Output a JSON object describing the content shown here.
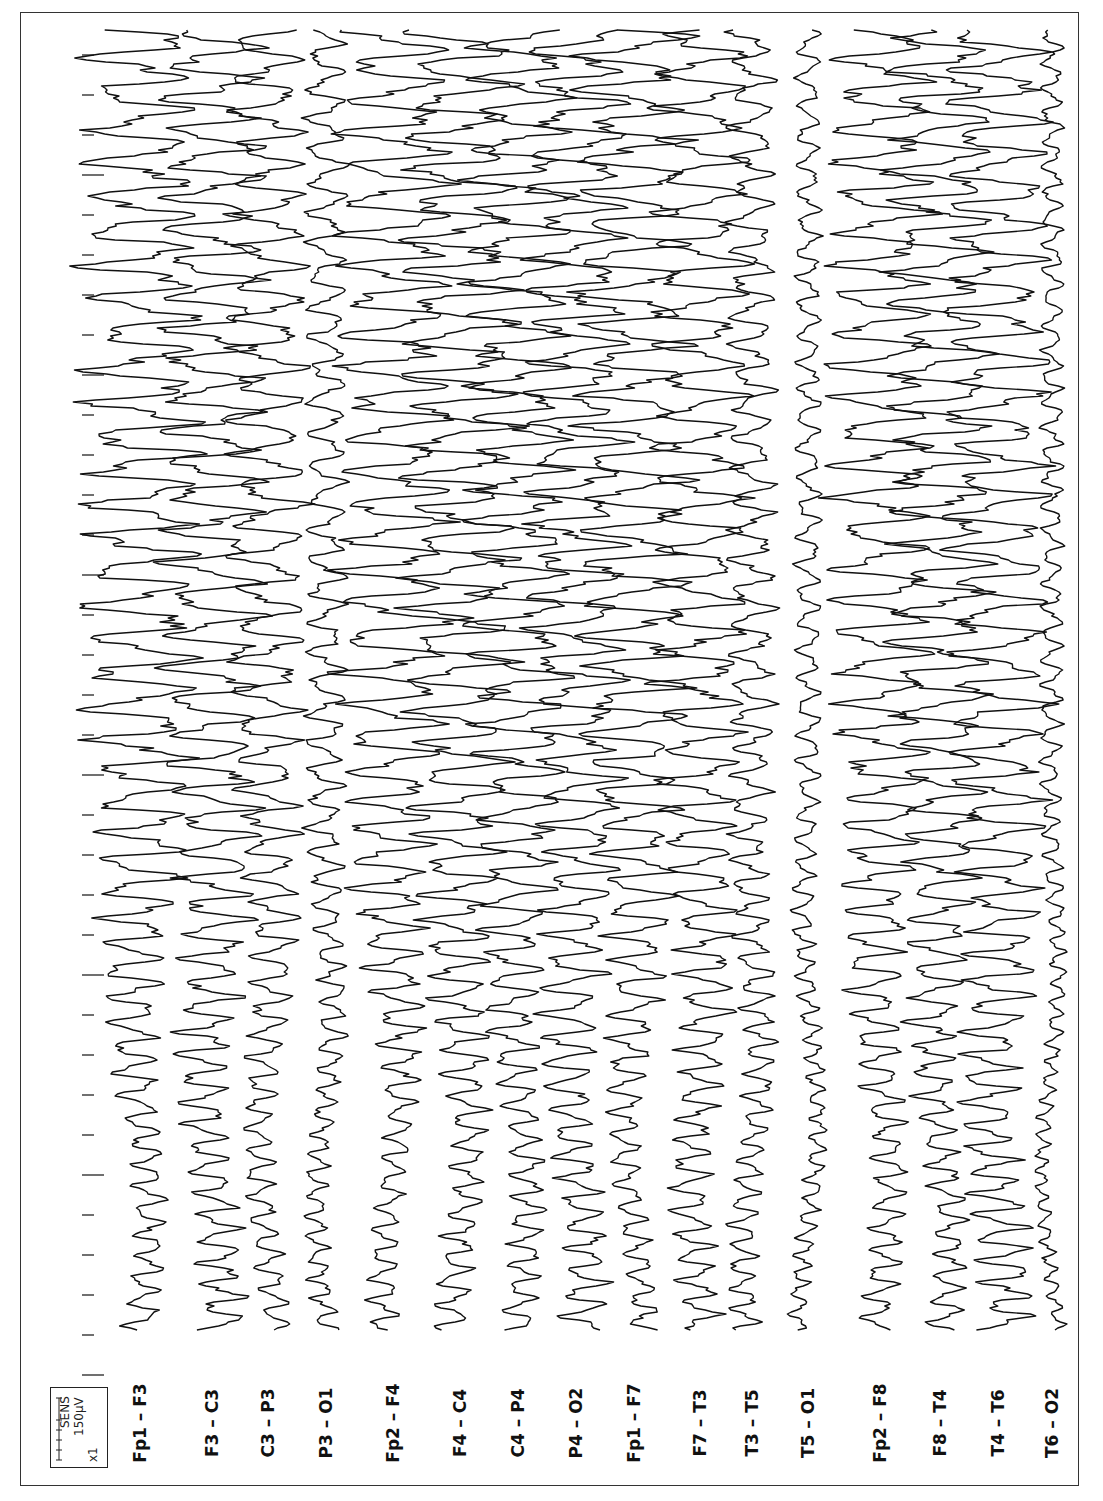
{
  "chart_data": {
    "type": "line",
    "title": "",
    "orientation": "rotated-90-ccw (time runs bottom-to-top, channels left-to-right)",
    "montage": "bipolar longitudinal (double banana)",
    "xlabel": "time (1 s per tick mark)",
    "ylabel": "amplitude",
    "sensitivity": {
      "label": "SENS",
      "value": "150μV",
      "gain": "x1"
    },
    "time_axis": {
      "tick_spacing_px": 40,
      "major_tick_every": 5,
      "tick_count": 34,
      "ticks": "short tick each interval, long tick every 5th"
    },
    "grid": false,
    "legend": "none",
    "series": [
      {
        "name": "Fp1 – F3",
        "baseline_x": 140,
        "onset_amp": 14,
        "ictal_amp": 46,
        "freq": 0.55
      },
      {
        "name": "F3 – C3",
        "baseline_x": 212,
        "onset_amp": 18,
        "ictal_amp": 40,
        "freq": 0.55
      },
      {
        "name": "C3 – P3",
        "baseline_x": 268,
        "onset_amp": 12,
        "ictal_amp": 30,
        "freq": 0.55
      },
      {
        "name": "P3 – O1",
        "baseline_x": 326,
        "onset_amp": 10,
        "ictal_amp": 16,
        "freq": 0.6
      },
      {
        "name": "Fp2 – F4",
        "baseline_x": 393,
        "onset_amp": 12,
        "ictal_amp": 44,
        "freq": 0.55
      },
      {
        "name": "F4 – C4",
        "baseline_x": 460,
        "onset_amp": 14,
        "ictal_amp": 44,
        "freq": 0.55
      },
      {
        "name": "C4 – P4",
        "baseline_x": 518,
        "onset_amp": 14,
        "ictal_amp": 40,
        "freq": 0.55
      },
      {
        "name": "P4 – O2",
        "baseline_x": 576,
        "onset_amp": 18,
        "ictal_amp": 38,
        "freq": 0.55
      },
      {
        "name": "Fp1 – F7",
        "baseline_x": 634,
        "onset_amp": 12,
        "ictal_amp": 44,
        "freq": 0.55
      },
      {
        "name": "F7 – T3",
        "baseline_x": 700,
        "onset_amp": 16,
        "ictal_amp": 36,
        "freq": 0.55
      },
      {
        "name": "T3 – T5",
        "baseline_x": 752,
        "onset_amp": 12,
        "ictal_amp": 18,
        "freq": 0.6
      },
      {
        "name": "T5 – O1",
        "baseline_x": 808,
        "onset_amp": 8,
        "ictal_amp": 10,
        "freq": 0.65
      },
      {
        "name": "Fp2 – F8",
        "baseline_x": 880,
        "onset_amp": 14,
        "ictal_amp": 40,
        "freq": 0.55
      },
      {
        "name": "F8 – T4",
        "baseline_x": 940,
        "onset_amp": 14,
        "ictal_amp": 40,
        "freq": 0.55
      },
      {
        "name": "T4 – T6",
        "baseline_x": 998,
        "onset_amp": 22,
        "ictal_amp": 40,
        "freq": 0.55
      },
      {
        "name": "T6 – O2",
        "baseline_x": 1052,
        "onset_amp": 6,
        "ictal_amp": 9,
        "freq": 0.7
      }
    ],
    "annotations": [
      "Slow rhythmic activity at record start (bottom) evolving into high-amplitude rhythmic ictal discharges (top)",
      "T5 – O1 and T6 – O2 remain relatively low amplitude throughout"
    ]
  },
  "labels": {
    "channels": [
      "Fp1 – F3",
      "F3 – C3",
      "C3 – P3",
      "P3 – O1",
      "Fp2 – F4",
      "F4 – C4",
      "C4 – P4",
      "P4 – O2",
      "Fp1 – F7",
      "F7 – T3",
      "T3 – T5",
      "T5 – O1",
      "Fp2 – F8",
      "F8 – T4",
      "T4 – T6",
      "T6 – O2"
    ],
    "sens_title": "SENS",
    "sens_value": "150μV",
    "sens_gain": "x1"
  },
  "colors": {
    "trace": "#111111",
    "frame": "#333333",
    "background": "#ffffff"
  }
}
